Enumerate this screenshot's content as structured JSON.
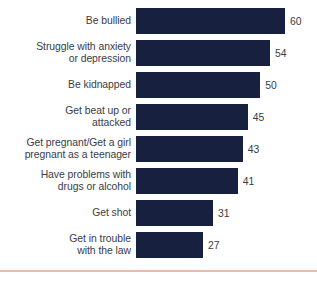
{
  "chart_data": {
    "type": "bar",
    "orientation": "horizontal",
    "title": "",
    "subtitle": "",
    "xlabel": "",
    "ylabel": "",
    "xlim": [
      0,
      60
    ],
    "grid": false,
    "legend": null,
    "value_labels_shown": true,
    "bar_color": "#18203f",
    "label_color": "#3b3b44",
    "background_color": "#ffffff",
    "rule_color": "#e8bda8",
    "categories": [
      "Be bullied",
      "Struggle with anxiety\nor depression",
      "Be kidnapped",
      "Get beat up or\nattacked",
      "Get pregnant/Get a girl\npregnant as a teenager",
      "Have problems with\ndrugs or alcohol",
      "Get shot",
      "Get in trouble\nwith the law"
    ],
    "values": [
      60,
      54,
      50,
      45,
      43,
      41,
      31,
      27
    ]
  },
  "rows": [
    {
      "label": "Be bullied",
      "value": 60,
      "value_text": "60"
    },
    {
      "label": "Struggle with anxiety\nor depression",
      "value": 54,
      "value_text": "54"
    },
    {
      "label": "Be kidnapped",
      "value": 50,
      "value_text": "50"
    },
    {
      "label": "Get beat up or\nattacked",
      "value": 45,
      "value_text": "45"
    },
    {
      "label": "Get pregnant/Get a girl\npregnant as a teenager",
      "value": 43,
      "value_text": "43"
    },
    {
      "label": "Have problems with\ndrugs or alcohol",
      "value": 41,
      "value_text": "41"
    },
    {
      "label": "Get shot",
      "value": 31,
      "value_text": "31"
    },
    {
      "label": "Get in trouble\nwith the law",
      "value": 27,
      "value_text": "27"
    }
  ]
}
